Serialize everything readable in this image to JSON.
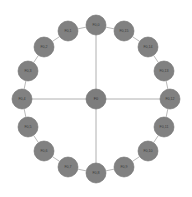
{
  "figure": {
    "title": "",
    "type": "ring-star network graph",
    "background_color": "#ffffff"
  },
  "style": {
    "node_fill": "#818181",
    "node_stroke": "#6f6f6f",
    "ring_edge_color": "#b9b9b9",
    "spoke_edge_color": "#b0b0b0",
    "label_color": "#3a3a3a",
    "node_radius": 10,
    "hub_radius": 10
  },
  "graph": {
    "center_x": 96,
    "center_y": 99,
    "ring_radius": 74,
    "node_count": 16,
    "hub": {
      "id": "hub",
      "label": "F0",
      "x": 96,
      "y": 99
    },
    "ring_nodes": [
      {
        "id": "n0",
        "label": "F0,0",
        "x": 96,
        "y": 25,
        "angle_deg": 90
      },
      {
        "id": "n1",
        "label": "F0,15",
        "x": 124,
        "y": 31,
        "angle_deg": 67.5
      },
      {
        "id": "n2",
        "label": "F0,14",
        "x": 148,
        "y": 47,
        "angle_deg": 45
      },
      {
        "id": "n3",
        "label": "F0,13",
        "x": 164,
        "y": 71,
        "angle_deg": 22.5
      },
      {
        "id": "n4",
        "label": "F0,12",
        "x": 170,
        "y": 99,
        "angle_deg": 0
      },
      {
        "id": "n5",
        "label": "F0,11",
        "x": 164,
        "y": 127,
        "angle_deg": 337.5
      },
      {
        "id": "n6",
        "label": "F0,10",
        "x": 148,
        "y": 151,
        "angle_deg": 315
      },
      {
        "id": "n7",
        "label": "F0,9",
        "x": 124,
        "y": 167,
        "angle_deg": 292.5
      },
      {
        "id": "n8",
        "label": "F0,8",
        "x": 96,
        "y": 173,
        "angle_deg": 270
      },
      {
        "id": "n9",
        "label": "F0,7",
        "x": 68,
        "y": 167,
        "angle_deg": 247.5
      },
      {
        "id": "n10",
        "label": "F0,6",
        "x": 44,
        "y": 151,
        "angle_deg": 225
      },
      {
        "id": "n11",
        "label": "F0,5",
        "x": 28,
        "y": 127,
        "angle_deg": 202.5
      },
      {
        "id": "n12",
        "label": "F0,4",
        "x": 22,
        "y": 99,
        "angle_deg": 180
      },
      {
        "id": "n13",
        "label": "F0,3",
        "x": 28,
        "y": 71,
        "angle_deg": 157.5
      },
      {
        "id": "n14",
        "label": "F0,2",
        "x": 44,
        "y": 47,
        "angle_deg": 135
      },
      {
        "id": "n15",
        "label": "F0,1",
        "x": 68,
        "y": 31,
        "angle_deg": 112.5
      }
    ],
    "ring_edges": [
      [
        "n0",
        "n1"
      ],
      [
        "n1",
        "n2"
      ],
      [
        "n2",
        "n3"
      ],
      [
        "n3",
        "n4"
      ],
      [
        "n4",
        "n5"
      ],
      [
        "n5",
        "n6"
      ],
      [
        "n6",
        "n7"
      ],
      [
        "n7",
        "n8"
      ],
      [
        "n8",
        "n9"
      ],
      [
        "n9",
        "n10"
      ],
      [
        "n10",
        "n11"
      ],
      [
        "n11",
        "n12"
      ],
      [
        "n12",
        "n13"
      ],
      [
        "n13",
        "n14"
      ],
      [
        "n14",
        "n15"
      ],
      [
        "n15",
        "n0"
      ]
    ],
    "spoke_edges": [
      [
        "hub",
        "n0"
      ],
      [
        "hub",
        "n4"
      ],
      [
        "hub",
        "n8"
      ],
      [
        "hub",
        "n12"
      ]
    ]
  }
}
